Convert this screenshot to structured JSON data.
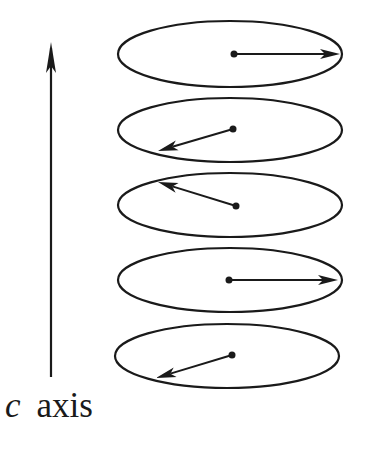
{
  "figure": {
    "type": "diagram",
    "stroke_color": "#1a1a1a",
    "background": "#ffffff"
  },
  "axis": {
    "variable": "c",
    "label": "axis",
    "x": 51,
    "y_start": 377,
    "y_tip": 42
  },
  "layers": [
    {
      "cx": 230,
      "cy": 54,
      "rx": 112,
      "ry": 33,
      "dot": [
        234,
        54
      ],
      "tip": [
        340,
        54
      ]
    },
    {
      "cx": 230,
      "cy": 130,
      "rx": 112,
      "ry": 32,
      "dot": [
        233,
        129
      ],
      "tip": [
        158,
        151
      ]
    },
    {
      "cx": 230,
      "cy": 205,
      "rx": 112,
      "ry": 32,
      "dot": [
        236,
        206
      ],
      "tip": [
        158,
        182
      ]
    },
    {
      "cx": 230,
      "cy": 280,
      "rx": 112,
      "ry": 32,
      "dot": [
        229,
        280
      ],
      "tip": [
        338,
        280
      ]
    },
    {
      "cx": 227,
      "cy": 356,
      "rx": 112,
      "ry": 32,
      "dot": [
        232,
        355
      ],
      "tip": [
        156,
        378
      ]
    }
  ]
}
